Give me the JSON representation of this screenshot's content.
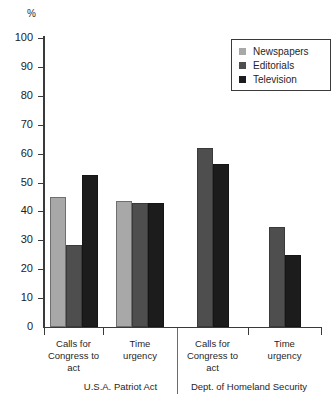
{
  "chart_data": {
    "type": "bar",
    "title": "",
    "xlabel": "",
    "ylabel": "%",
    "ylim": [
      0,
      100
    ],
    "ytick_values": [
      0,
      10,
      20,
      30,
      40,
      50,
      60,
      70,
      80,
      90,
      100
    ],
    "ytick_labels": [
      "0",
      "10",
      "20",
      "30",
      "40",
      "50",
      "60",
      "70",
      "80",
      "90",
      "100"
    ],
    "grid": false,
    "legend_position": "top-right",
    "groups": [
      {
        "label": "U.S.A. Patriot Act"
      },
      {
        "label": "Dept. of Homeland Security"
      }
    ],
    "categories": [
      "Calls for Congress to act",
      "Time urgency",
      "Calls for Congress to act",
      "Time urgency"
    ],
    "category_lines": [
      [
        "Calls for",
        "Congress to",
        "act"
      ],
      [
        "Time",
        "urgency"
      ],
      [
        "Calls for",
        "Congress to",
        "act"
      ],
      [
        "Time",
        "urgency"
      ]
    ],
    "series": [
      {
        "name": "Newspapers",
        "color": "#a8a8a8",
        "values": [
          45,
          43.5,
          null,
          null
        ]
      },
      {
        "name": "Editorials",
        "color": "#4e4e4e",
        "values": [
          28.5,
          43,
          62,
          34.5
        ]
      },
      {
        "name": "Television",
        "color": "#1c1c1c",
        "values": [
          52.5,
          43,
          56.5,
          25
        ]
      }
    ],
    "legend": [
      {
        "label": "Newspapers",
        "color": "#a8a8a8"
      },
      {
        "label": "Editorials",
        "color": "#4e4e4e"
      },
      {
        "label": "Television",
        "color": "#1c1c1c"
      }
    ]
  }
}
